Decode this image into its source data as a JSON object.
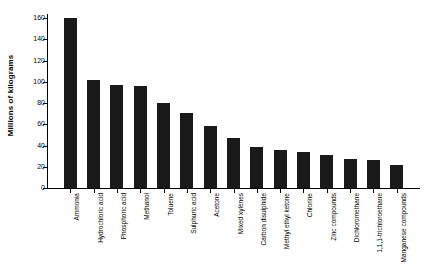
{
  "chart_data": {
    "type": "bar",
    "title": "",
    "xlabel": "",
    "ylabel": "Millions of kilograms",
    "ylim": [
      0,
      160
    ],
    "yticks": [
      0,
      20,
      40,
      60,
      80,
      100,
      120,
      140,
      160
    ],
    "grid": false,
    "legend": null,
    "bar_color": "#1a1a1a",
    "categories": [
      "Ammonia",
      "Hydrochloric acid",
      "Phosphoric acid",
      "Methanol",
      "Toluene",
      "Sulphuric acid",
      "Acetone",
      "Mixed xylenes",
      "Carbon disulphide",
      "Methyl ethyl ketone",
      "Chlorine",
      "Zinc compounds",
      "Dichloromethane",
      "1,1,1-trichloroethane",
      "Manganese compounds"
    ],
    "values": [
      160,
      102,
      97,
      96,
      80,
      71,
      58,
      47,
      39,
      36,
      34,
      31,
      27,
      26,
      22
    ]
  },
  "axis": {
    "y_title": "Millions of kilograms",
    "tick_labels": [
      "160",
      "140",
      "120",
      "100",
      "80",
      "60",
      "40",
      "20",
      "0"
    ]
  }
}
